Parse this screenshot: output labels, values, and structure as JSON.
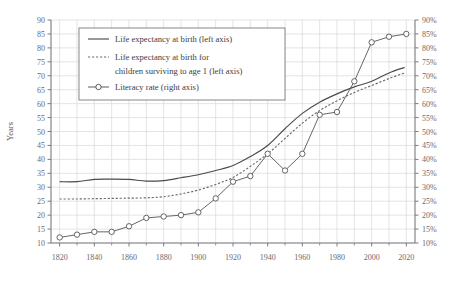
{
  "chart_data": {
    "type": "line",
    "title": "",
    "xlabel": "",
    "ylabel": "Years",
    "y2label": "",
    "xlim": [
      1815,
      2025
    ],
    "ylim": [
      10,
      90
    ],
    "y2lim": [
      10,
      90
    ],
    "grid": true,
    "legend_position": "upper-left",
    "x_ticks": [
      1820,
      1840,
      1860,
      1880,
      1900,
      1920,
      1940,
      1960,
      1980,
      2000,
      2020
    ],
    "y_ticks": [
      10,
      15,
      20,
      25,
      30,
      35,
      40,
      45,
      50,
      55,
      60,
      65,
      70,
      75,
      80,
      85,
      90
    ],
    "y2_ticks": [
      "10%",
      "15%",
      "20%",
      "25%",
      "30%",
      "35%",
      "40%",
      "45%",
      "50%",
      "55%",
      "60%",
      "65%",
      "70%",
      "75%",
      "80%",
      "85%",
      "90%"
    ],
    "series": [
      {
        "name": "Life expectancy at birth (left axis)",
        "axis": "left",
        "style": "solid",
        "marker": "none",
        "color": "#4a4a4f",
        "x": [
          1820,
          1830,
          1840,
          1850,
          1860,
          1870,
          1880,
          1890,
          1900,
          1910,
          1920,
          1930,
          1940,
          1950,
          1960,
          1970,
          1980,
          1990,
          2000,
          2010,
          2019
        ],
        "values": [
          32.0,
          32.0,
          32.8,
          32.9,
          32.8,
          32.2,
          32.4,
          33.4,
          34.5,
          36.0,
          37.8,
          41.0,
          45.0,
          51.0,
          56.5,
          60.5,
          63.5,
          66.0,
          68.0,
          71.0,
          73.0
        ]
      },
      {
        "name": "Life expectancy at birth for children surviving to age 1 (left axis)",
        "axis": "left",
        "style": "dashed",
        "marker": "none",
        "color": "#6b6b70",
        "x": [
          1820,
          1830,
          1840,
          1850,
          1860,
          1870,
          1880,
          1890,
          1900,
          1910,
          1920,
          1930,
          1940,
          1950,
          1960,
          1970,
          1980,
          1990,
          2000,
          2010,
          2019
        ],
        "values": [
          25.8,
          25.8,
          25.9,
          26.0,
          26.1,
          26.2,
          26.6,
          27.6,
          29.0,
          31.0,
          33.5,
          37.5,
          42.0,
          47.5,
          53.0,
          57.5,
          61.0,
          64.0,
          66.5,
          69.0,
          71.0
        ]
      },
      {
        "name": "Literacy rate (right axis)",
        "axis": "right",
        "style": "solid",
        "marker": "circle",
        "color": "#55555a",
        "x": [
          1820,
          1830,
          1840,
          1850,
          1860,
          1870,
          1880,
          1890,
          1900,
          1910,
          1920,
          1930,
          1940,
          1950,
          1960,
          1970,
          1980,
          1990,
          2000,
          2010,
          2020
        ],
        "values": [
          12,
          13,
          14,
          14,
          16,
          19,
          19.5,
          20,
          21,
          26,
          32,
          34,
          42,
          36,
          42,
          56,
          57,
          68,
          82,
          84,
          85
        ]
      }
    ],
    "annotations": []
  },
  "legend": {
    "items": [
      {
        "label": "Life expectancy at birth (left axis)",
        "style": "solid",
        "marker": "none"
      },
      {
        "label_line1": "Life expectancy at birth for",
        "label_line2": "children surviving to age 1 (left axis)",
        "style": "dashed",
        "marker": "none"
      },
      {
        "label": "Literacy rate (right axis)",
        "style": "solid",
        "marker": "circle"
      }
    ]
  },
  "colors": {
    "line_primary": "#4a4a4f",
    "line_secondary": "#6b6b70",
    "grid": "#d9d9dd",
    "axis": "#7a7a80",
    "text": "#55555a",
    "background": "#ffffff"
  }
}
